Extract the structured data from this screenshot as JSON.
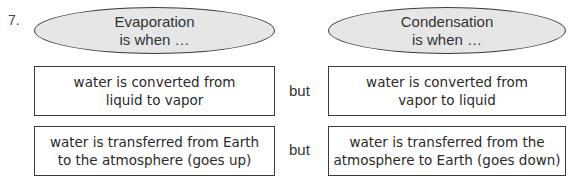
{
  "question_number": "7.",
  "columns": [
    {
      "heading_line1": "Evaporation",
      "heading_line2": "is when …",
      "statements": [
        {
          "line1": "water is converted from",
          "line2": "liquid to vapor"
        },
        {
          "line1": "water is transferred from Earth",
          "line2": "to the atmosphere (goes up)"
        }
      ]
    },
    {
      "heading_line1": "Condensation",
      "heading_line2": "is when …",
      "statements": [
        {
          "line1": "water is converted from",
          "line2": "vapor to liquid"
        },
        {
          "line1": "water is transferred from the",
          "line2": "atmosphere to Earth (goes down)"
        }
      ]
    }
  ],
  "connector": [
    "but",
    "but"
  ]
}
